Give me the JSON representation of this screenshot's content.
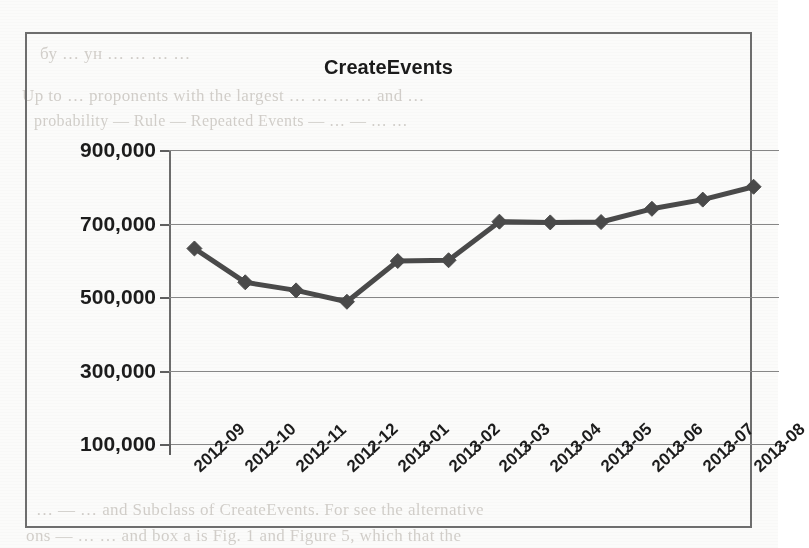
{
  "page": {
    "background_bleed_lines": [
      "бу … ун … … … …",
      "Up   to   …   proponents with the largest   …   … … …   and  …",
      "probability  —   Rule   —   Repeated Events   —   … —  … …",
      "… — … and Subclass of CreateEvents. For see  the alternative",
      "ons  — … …  and box a is Fig. 1 and Figure 5, which that  the"
    ]
  },
  "figure": {
    "frame_color": "#6e6e6e"
  },
  "chart_data": {
    "type": "line",
    "title": "CreateEvents",
    "xlabel": "",
    "ylabel": "",
    "categories": [
      "2012-09",
      "2012-10",
      "2012-11",
      "2012-12",
      "2013-01",
      "2013-02",
      "2013-03",
      "2013-04",
      "2013-05",
      "2013-06",
      "2013-07",
      "2013-08"
    ],
    "values": [
      632000,
      540000,
      518000,
      487000,
      598000,
      600000,
      705000,
      703000,
      704000,
      740000,
      765000,
      800000
    ],
    "ylim": [
      100000,
      900000
    ],
    "yticks": [
      100000,
      300000,
      500000,
      700000,
      900000
    ],
    "ytick_labels": [
      "100,000",
      "300,000",
      "500,000",
      "700,000",
      "900,000"
    ],
    "grid": true,
    "legend": false,
    "series_color": "#4a4a4a",
    "marker": "diamond",
    "line_width": 5
  }
}
